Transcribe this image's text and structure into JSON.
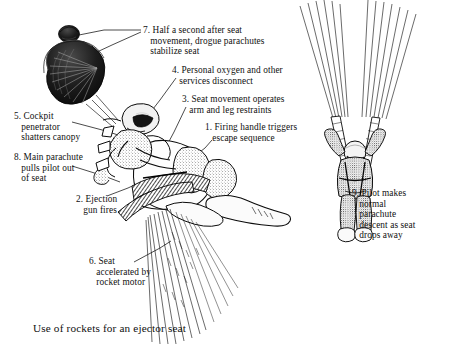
{
  "figure": {
    "title": "Use of rockets for an ejector seat",
    "caption": "Use of rockets for an ejector seat",
    "ink_color": "#101010",
    "background_color": "#ffffff",
    "subjects": [
      "drogue-parachute",
      "ejecting-pilot-in-seat",
      "rocket-exhaust-plume",
      "descending-pilot-under-main-parachute"
    ]
  },
  "callouts": [
    {
      "id": "7",
      "number": "7.",
      "lines": [
        "Half a second after seat",
        "movement, drogue parachutes",
        "stabilize seat"
      ],
      "text": "7. Half a second after seat movement, drogue parachutes stabilize seat",
      "points_to": "drogue-parachute"
    },
    {
      "id": "4",
      "number": "4.",
      "lines": [
        "Personal oxygen and other",
        "services disconnect"
      ],
      "text": "4. Personal oxygen and other services disconnect",
      "points_to": "pilot-helmet-services"
    },
    {
      "id": "3",
      "number": "3.",
      "lines": [
        "Seat movement operates",
        "arm and leg restraints"
      ],
      "text": "3. Seat movement operates arm and leg restraints",
      "points_to": "seat-restraints"
    },
    {
      "id": "1",
      "number": "1.",
      "lines": [
        "Firing handle triggers",
        "escape sequence"
      ],
      "text": "1. Firing handle triggers escape sequence",
      "points_to": "firing-handle"
    },
    {
      "id": "5",
      "number": "5.",
      "lines": [
        "Cockpit",
        "penetrator",
        "shatters canopy"
      ],
      "text": "5. Cockpit penetrator shatters canopy",
      "points_to": "cockpit-penetrator"
    },
    {
      "id": "8",
      "number": "8.",
      "lines": [
        "Main parachute",
        "pulls pilot out",
        "of seat"
      ],
      "text": "8. Main parachute pulls pilot out of seat",
      "points_to": "main-parachute-risers"
    },
    {
      "id": "2",
      "number": "2.",
      "lines": [
        "Ejection",
        "gun fires"
      ],
      "text": "2. Ejection gun fires",
      "points_to": "ejection-gun"
    },
    {
      "id": "6",
      "number": "6.",
      "lines": [
        "Seat",
        "accelerated by",
        "rocket motor"
      ],
      "text": "6. Seat accelerated by rocket motor",
      "points_to": "rocket-motor-exhaust"
    },
    {
      "id": "9",
      "number": "9.",
      "lines": [
        "Pilot makes",
        "normal",
        "parachute",
        "descent as seat",
        "drops away"
      ],
      "text": "9. Pilot makes normal parachute descent as seat drops away",
      "points_to": "descending-pilot"
    }
  ]
}
